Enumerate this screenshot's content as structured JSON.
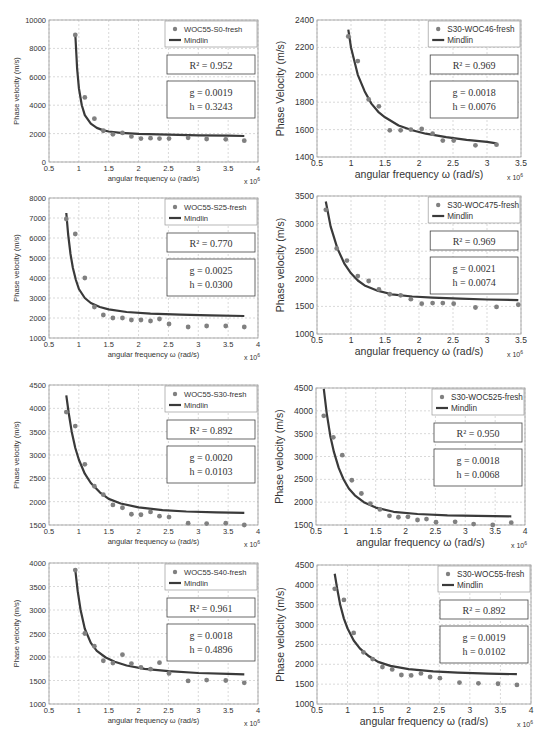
{
  "chart_data": [
    {
      "id": "p1",
      "type": "scatter",
      "title": "",
      "xlabel": "angular frequency ω (rad/s)",
      "ylabel": "Phase velocity (m/s)",
      "x_multiplier": "x 10^6",
      "xlim": [
        0.5,
        4
      ],
      "ylim": [
        0,
        10000
      ],
      "xticks": [
        0.5,
        1,
        1.5,
        2,
        2.5,
        3,
        3.5,
        4
      ],
      "yticks": [
        0,
        2000,
        4000,
        6000,
        8000,
        10000
      ],
      "grid": true,
      "legend": {
        "position": "top-right",
        "entries": [
          "WOC55-S0-fresh",
          "Mindlin"
        ]
      },
      "annotations": {
        "r2": "R² = 0.952",
        "g": "g = 0.0019",
        "h": "h = 0.3243"
      },
      "series": [
        {
          "name": "WOC55-S0-fresh",
          "kind": "markers",
          "x": [
            0.94,
            1.1,
            1.26,
            1.41,
            1.57,
            1.73,
            1.88,
            2.04,
            2.2,
            2.35,
            2.51,
            2.83,
            3.14,
            3.46,
            3.77
          ],
          "y": [
            8950,
            4550,
            3050,
            2200,
            1950,
            2050,
            1800,
            1650,
            1680,
            1650,
            1650,
            1700,
            1620,
            1600,
            1500
          ]
        },
        {
          "name": "Mindlin",
          "kind": "line",
          "x": [
            0.94,
            0.97,
            1.0,
            1.05,
            1.1,
            1.2,
            1.3,
            1.4,
            1.5,
            1.7,
            2.0,
            2.5,
            3.0,
            3.5,
            3.77
          ],
          "y": [
            9000,
            6600,
            5200,
            4000,
            3300,
            2700,
            2400,
            2250,
            2150,
            2050,
            1980,
            1920,
            1880,
            1850,
            1830
          ]
        }
      ]
    },
    {
      "id": "p2",
      "type": "scatter",
      "title": "",
      "xlabel": "angular frequency ω (rad/s)",
      "ylabel": "Phase Velocity (m/s)",
      "x_multiplier": "x 10^6",
      "xlim": [
        0.5,
        3.5
      ],
      "ylim": [
        1400,
        2400
      ],
      "xticks": [
        0.5,
        1,
        1.5,
        2,
        2.5,
        3,
        3.5
      ],
      "yticks": [
        1400,
        1600,
        1800,
        2000,
        2200,
        2400
      ],
      "grid": true,
      "legend": {
        "position": "top-right",
        "entries": [
          "S30-WOC46-fresh",
          "Mindlin"
        ]
      },
      "annotations": {
        "r2": "R² = 0.969",
        "g": "g = 0.0018",
        "h": "h = 0.0076"
      },
      "series": [
        {
          "name": "S30-WOC46-fresh",
          "kind": "markers",
          "x": [
            0.96,
            1.1,
            1.26,
            1.41,
            1.57,
            1.73,
            1.88,
            2.04,
            2.2,
            2.35,
            2.51,
            2.83,
            3.14
          ],
          "y": [
            2280,
            2100,
            1820,
            1770,
            1595,
            1595,
            1600,
            1605,
            1570,
            1520,
            1520,
            1485,
            1490
          ]
        },
        {
          "name": "Mindlin",
          "kind": "line",
          "x": [
            0.96,
            1.0,
            1.1,
            1.2,
            1.3,
            1.4,
            1.5,
            1.7,
            1.9,
            2.1,
            2.4,
            2.7,
            3.0,
            3.14
          ],
          "y": [
            2330,
            2200,
            2000,
            1880,
            1790,
            1730,
            1690,
            1630,
            1595,
            1570,
            1545,
            1525,
            1510,
            1500
          ]
        }
      ]
    },
    {
      "id": "p3",
      "type": "scatter",
      "title": "",
      "xlabel": "angular frequency ω (rad/s)",
      "ylabel": "Phase velocity (m/s)",
      "x_multiplier": "x 10^6",
      "xlim": [
        0.5,
        4
      ],
      "ylim": [
        1000,
        8000
      ],
      "xticks": [
        0.5,
        1,
        1.5,
        2,
        2.5,
        3,
        3.5,
        4
      ],
      "yticks": [
        1000,
        2000,
        3000,
        4000,
        5000,
        6000,
        7000,
        8000
      ],
      "grid": true,
      "legend": {
        "position": "top-right",
        "entries": [
          "WOC55-S25-fresh",
          "Mindlin"
        ]
      },
      "annotations": {
        "r2": "R² = 0.770",
        "g": "g = 0.0025",
        "h": "h = 0.0300"
      },
      "series": [
        {
          "name": "WOC55-S25-fresh",
          "kind": "markers",
          "x": [
            0.79,
            0.94,
            1.1,
            1.26,
            1.41,
            1.57,
            1.73,
            1.88,
            2.04,
            2.2,
            2.35,
            2.51,
            2.83,
            3.14,
            3.46,
            3.77
          ],
          "y": [
            6950,
            6200,
            4000,
            2550,
            2150,
            2000,
            2000,
            1900,
            1900,
            1850,
            1950,
            1700,
            1550,
            1600,
            1600,
            1550
          ]
        },
        {
          "name": "Mindlin",
          "kind": "line",
          "x": [
            0.79,
            0.82,
            0.86,
            0.9,
            0.95,
            1.0,
            1.1,
            1.2,
            1.35,
            1.5,
            1.8,
            2.2,
            2.7,
            3.2,
            3.77
          ],
          "y": [
            7250,
            6200,
            5200,
            4500,
            3900,
            3450,
            3000,
            2750,
            2550,
            2430,
            2300,
            2220,
            2170,
            2130,
            2100
          ]
        }
      ]
    },
    {
      "id": "p4",
      "type": "scatter",
      "title": "",
      "xlabel": "angular frequency ω (rad/s)",
      "ylabel": "Phase velocity (m/s)",
      "x_multiplier": "x 10^6",
      "xlim": [
        0.5,
        3.5
      ],
      "ylim": [
        1000,
        3500
      ],
      "xticks": [
        0.5,
        1,
        1.5,
        2,
        2.5,
        3,
        3.5
      ],
      "yticks": [
        1000,
        1500,
        2000,
        2500,
        3000,
        3500
      ],
      "grid": true,
      "legend": {
        "position": "top-right",
        "entries": [
          "S30-WOC475-fresh",
          "Mindlin"
        ]
      },
      "annotations": {
        "r2": "R² = 0.969",
        "g": "g = 0.0021",
        "h": "h = 0.0074"
      },
      "series": [
        {
          "name": "S30-WOC475-fresh",
          "kind": "markers",
          "x": [
            0.63,
            0.79,
            0.94,
            1.1,
            1.26,
            1.41,
            1.57,
            1.73,
            1.88,
            2.04,
            2.2,
            2.35,
            2.51,
            2.83,
            3.14,
            3.46
          ],
          "y": [
            3250,
            2550,
            2330,
            2050,
            1960,
            1810,
            1720,
            1700,
            1630,
            1550,
            1560,
            1560,
            1550,
            1480,
            1490,
            1530
          ]
        },
        {
          "name": "Mindlin",
          "kind": "line",
          "x": [
            0.63,
            0.7,
            0.8,
            0.9,
            1.0,
            1.1,
            1.2,
            1.4,
            1.6,
            1.9,
            2.2,
            2.6,
            3.0,
            3.46
          ],
          "y": [
            3400,
            2950,
            2550,
            2280,
            2100,
            1970,
            1880,
            1780,
            1720,
            1680,
            1660,
            1640,
            1625,
            1615
          ]
        }
      ]
    },
    {
      "id": "p5",
      "type": "scatter",
      "title": "",
      "xlabel": "angular frequency ω (rad/s)",
      "ylabel": "Phase velocity (m/s)",
      "x_multiplier": "x 10^6",
      "xlim": [
        0.5,
        4
      ],
      "ylim": [
        1500,
        4500
      ],
      "xticks": [
        0.5,
        1,
        1.5,
        2,
        2.5,
        3,
        3.5,
        4
      ],
      "yticks": [
        1500,
        2000,
        2500,
        3000,
        3500,
        4000,
        4500
      ],
      "grid": true,
      "legend": {
        "position": "top-right",
        "entries": [
          "WOC55-S30-fresh",
          "Mindlin"
        ]
      },
      "annotations": {
        "r2": "R² = 0.892",
        "g": "g = 0.0020",
        "h": "h = 0.0103"
      },
      "series": [
        {
          "name": "WOC55-S30-fresh",
          "kind": "markers",
          "x": [
            0.79,
            0.94,
            1.1,
            1.26,
            1.41,
            1.57,
            1.73,
            1.88,
            2.04,
            2.2,
            2.35,
            2.51,
            2.83,
            3.14,
            3.46,
            3.77
          ],
          "y": [
            3920,
            3620,
            2800,
            2330,
            2150,
            1930,
            1870,
            1730,
            1720,
            1780,
            1690,
            1670,
            1540,
            1530,
            1540,
            1500
          ]
        },
        {
          "name": "Mindlin",
          "kind": "line",
          "x": [
            0.79,
            0.83,
            0.88,
            0.94,
            1.0,
            1.1,
            1.2,
            1.35,
            1.5,
            1.7,
            2.0,
            2.4,
            2.8,
            3.3,
            3.77
          ],
          "y": [
            4280,
            3900,
            3500,
            3150,
            2900,
            2600,
            2400,
            2200,
            2060,
            1960,
            1880,
            1820,
            1790,
            1770,
            1760
          ]
        }
      ]
    },
    {
      "id": "p6",
      "type": "scatter",
      "title": "",
      "xlabel": "angular frequency ω (rad/s)",
      "ylabel": "Phase velocity (m/s)",
      "x_multiplier": "x 10^6",
      "xlim": [
        0.5,
        4
      ],
      "ylim": [
        1500,
        4500
      ],
      "xticks": [
        0.5,
        1,
        1.5,
        2,
        2.5,
        3,
        3.5,
        4
      ],
      "yticks": [
        1500,
        2000,
        2500,
        3000,
        3500,
        4000,
        4500
      ],
      "grid": true,
      "legend": {
        "position": "top-right",
        "entries": [
          "S30-WOC525-fresh",
          "Mindlin"
        ]
      },
      "annotations": {
        "r2": "R² = 0.950",
        "g": "g = 0.0018",
        "h": "h = 0.0068"
      },
      "series": [
        {
          "name": "S30-WOC525-fresh",
          "kind": "markers",
          "x": [
            0.63,
            0.79,
            0.94,
            1.1,
            1.26,
            1.41,
            1.57,
            1.73,
            1.88,
            2.04,
            2.2,
            2.35,
            2.51,
            2.83,
            3.14,
            3.46,
            3.77
          ],
          "y": [
            3890,
            3420,
            3030,
            2480,
            2190,
            1970,
            1840,
            1700,
            1670,
            1680,
            1610,
            1630,
            1560,
            1570,
            1520,
            1500,
            1550
          ]
        },
        {
          "name": "Mindlin",
          "kind": "line",
          "x": [
            0.63,
            0.68,
            0.74,
            0.8,
            0.88,
            0.96,
            1.05,
            1.15,
            1.3,
            1.5,
            1.8,
            2.2,
            2.7,
            3.2,
            3.77
          ],
          "y": [
            4480,
            3950,
            3450,
            3100,
            2750,
            2500,
            2300,
            2150,
            2000,
            1880,
            1790,
            1740,
            1710,
            1700,
            1690
          ]
        }
      ]
    },
    {
      "id": "p7",
      "type": "scatter",
      "title": "",
      "xlabel": "angular frequency ω (rad/s)",
      "ylabel": "Phase velocity (m/s)",
      "x_multiplier": "x 10^6",
      "xlim": [
        0.5,
        4
      ],
      "ylim": [
        1000,
        4000
      ],
      "xticks": [
        0.5,
        1,
        1.5,
        2,
        2.5,
        3,
        3.5,
        4
      ],
      "yticks": [
        1000,
        1500,
        2000,
        2500,
        3000,
        3500,
        4000
      ],
      "grid": true,
      "legend": {
        "position": "top-right",
        "entries": [
          "WOC55-S40-fresh",
          "Mindlin"
        ]
      },
      "annotations": {
        "r2": "R² = 0.961",
        "g": "g = 0.0018",
        "h": "h = 0.4896"
      },
      "series": [
        {
          "name": "WOC55-S40-fresh",
          "kind": "markers",
          "x": [
            0.94,
            1.1,
            1.26,
            1.41,
            1.57,
            1.73,
            1.88,
            2.04,
            2.2,
            2.35,
            2.51,
            2.83,
            3.14,
            3.46,
            3.77
          ],
          "y": [
            3850,
            2500,
            2230,
            1920,
            1870,
            2050,
            1860,
            1780,
            1740,
            1880,
            1650,
            1490,
            1510,
            1500,
            1450
          ]
        },
        {
          "name": "Mindlin",
          "kind": "line",
          "x": [
            0.94,
            0.98,
            1.03,
            1.1,
            1.2,
            1.3,
            1.45,
            1.6,
            1.8,
            2.1,
            2.5,
            3.0,
            3.5,
            3.77
          ],
          "y": [
            3850,
            3400,
            3000,
            2600,
            2300,
            2130,
            1990,
            1900,
            1820,
            1750,
            1700,
            1660,
            1640,
            1630
          ]
        }
      ]
    },
    {
      "id": "p8",
      "type": "scatter",
      "title": "",
      "xlabel": "angular frequency ω (rad/s)",
      "ylabel": "Phase velocity (m/s)",
      "x_multiplier": "x 10^6",
      "xlim": [
        0.5,
        4
      ],
      "ylim": [
        1000,
        4500
      ],
      "xticks": [
        0.5,
        1,
        1.5,
        2,
        2.5,
        3,
        3.5,
        4
      ],
      "yticks": [
        1000,
        1500,
        2000,
        2500,
        3000,
        3500,
        4000,
        4500
      ],
      "grid": true,
      "legend": {
        "position": "top-right",
        "entries": [
          "S30-WOC55-fresh",
          "Mindlin"
        ]
      },
      "annotations": {
        "r2": "R² = 0.892",
        "g": "g = 0.0019",
        "h": "h = 0.0102"
      },
      "series": [
        {
          "name": "S30-WOC55-fresh",
          "kind": "markers",
          "x": [
            0.79,
            0.94,
            1.1,
            1.26,
            1.41,
            1.57,
            1.73,
            1.88,
            2.04,
            2.2,
            2.35,
            2.51,
            2.83,
            3.14,
            3.46,
            3.77
          ],
          "y": [
            3900,
            3620,
            2790,
            2300,
            2130,
            1930,
            1870,
            1730,
            1720,
            1770,
            1680,
            1650,
            1540,
            1520,
            1510,
            1480
          ]
        },
        {
          "name": "Mindlin",
          "kind": "line",
          "x": [
            0.79,
            0.83,
            0.88,
            0.94,
            1.0,
            1.1,
            1.2,
            1.35,
            1.5,
            1.7,
            2.0,
            2.4,
            2.8,
            3.3,
            3.77
          ],
          "y": [
            4280,
            3900,
            3500,
            3150,
            2900,
            2600,
            2400,
            2200,
            2060,
            1960,
            1880,
            1820,
            1790,
            1765,
            1750
          ]
        }
      ]
    }
  ],
  "layout": {
    "panels": [
      {
        "id": "p1",
        "plot": [
          49,
          20,
          258,
          162
        ],
        "label_size": "small"
      },
      {
        "id": "p2",
        "plot": [
          317,
          20,
          521,
          157
        ],
        "label_size": "large"
      },
      {
        "id": "p3",
        "plot": [
          49,
          198,
          258,
          338
        ],
        "label_size": "small"
      },
      {
        "id": "p4",
        "plot": [
          317,
          196,
          521,
          334
        ],
        "label_size": "large"
      },
      {
        "id": "p5",
        "plot": [
          49,
          385,
          258,
          525
        ],
        "label_size": "small"
      },
      {
        "id": "p6",
        "plot": [
          316,
          388,
          525,
          525
        ],
        "label_size": "large"
      },
      {
        "id": "p7",
        "plot": [
          49,
          563,
          258,
          704
        ],
        "label_size": "small"
      },
      {
        "id": "p8",
        "plot": [
          317,
          565,
          531,
          704
        ],
        "label_size": "large"
      }
    ]
  },
  "colors": {
    "marker": "#808080",
    "line": "#3a3a3a",
    "grid": "#c8c8c8",
    "axis": "#555555",
    "text": "#333333"
  }
}
